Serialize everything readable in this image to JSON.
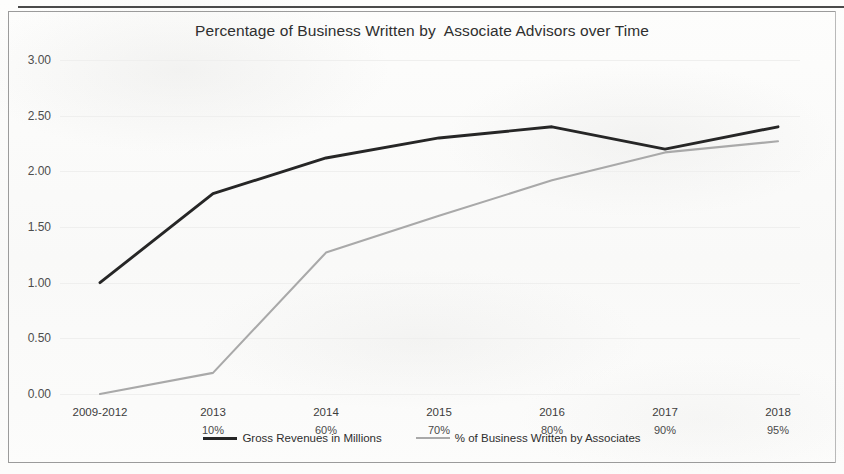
{
  "chart_data": {
    "type": "line",
    "title": "Percentage of Business Written by  Associate Advisors over Time",
    "xlabel": "",
    "ylabel": "",
    "ylim": [
      0,
      3
    ],
    "ytick_labels": [
      "3.00",
      "2.50",
      "2.00",
      "1.50",
      "1.00",
      "0.50",
      "0.00"
    ],
    "ytick_values": [
      3.0,
      2.5,
      2.0,
      1.5,
      1.0,
      0.5,
      0.0
    ],
    "grid": true,
    "legend_position": "bottom-center",
    "categories": [
      "2009-2012",
      "2013",
      "2014",
      "2015",
      "2016",
      "2017",
      "2018"
    ],
    "category_sublabels": [
      "",
      "10%",
      "60%",
      "70%",
      "80%",
      "90%",
      "95%"
    ],
    "series": [
      {
        "name": "Gross Revenues in Millions",
        "color": "#262626",
        "values": [
          1.0,
          1.8,
          2.12,
          2.3,
          2.4,
          2.2,
          2.4
        ]
      },
      {
        "name": "% of Business Written by Associates",
        "color": "#a9a9a9",
        "values": [
          0.0,
          0.19,
          1.27,
          1.6,
          1.92,
          2.17,
          2.27
        ]
      }
    ]
  },
  "axis": {
    "y": [
      {
        "label": "3.00"
      },
      {
        "label": "2.50"
      },
      {
        "label": "2.00"
      },
      {
        "label": "1.50"
      },
      {
        "label": "1.00"
      },
      {
        "label": "0.50"
      },
      {
        "label": "0.00"
      }
    ],
    "x": [
      {
        "label": "2009-2012",
        "pct": ""
      },
      {
        "label": "2013",
        "pct": "10%"
      },
      {
        "label": "2014",
        "pct": "60%"
      },
      {
        "label": "2015",
        "pct": "70%"
      },
      {
        "label": "2016",
        "pct": "80%"
      },
      {
        "label": "2017",
        "pct": "90%"
      },
      {
        "label": "2018",
        "pct": "95%"
      }
    ]
  },
  "legend": {
    "items": [
      {
        "label": "Gross Revenues in Millions"
      },
      {
        "label": "% of Business Written by Associates"
      }
    ]
  }
}
